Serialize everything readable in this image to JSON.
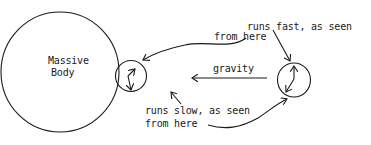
{
  "diagram": {
    "massive_body": {
      "label_line1": "Massive",
      "label_line2": "Body"
    },
    "gravity_label": "gravity",
    "near_clock_caption": {
      "line1": "runs slow, as seen",
      "line2": "from here"
    },
    "far_clock_caption": {
      "line1": "runs fast, as seen",
      "line2": "from here"
    },
    "colors": {
      "ink": "#1a1a1a",
      "background": "#ffffff"
    }
  }
}
